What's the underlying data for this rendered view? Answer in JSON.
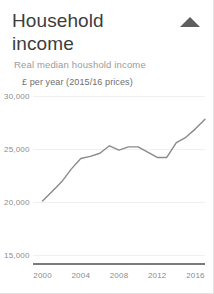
{
  "card": {
    "title": "Household income",
    "subtitle": "Real median houshold income",
    "axis_unit_label": "£ per year (2015/16 prices)",
    "collapse_icon": "triangle-up-icon",
    "accent_color": "#8a8a8a",
    "text_color": "#3d3d3d",
    "muted_color": "#9b9b9b",
    "border_color": "#e3e3e3"
  },
  "chart_data": {
    "type": "line",
    "title": "Household income",
    "subtitle": "Real median houshold income",
    "xlabel": "",
    "ylabel": "£ per year (2015/16 prices)",
    "xlim": [
      1999,
      2017
    ],
    "ylim": [
      15000,
      30000
    ],
    "grid": true,
    "legend": "none",
    "ytick_labels": [
      "30,000",
      "25,000",
      "20,000",
      "15,000"
    ],
    "ytick_values": [
      30000,
      25000,
      20000,
      15000
    ],
    "xtick_labels": [
      "2000",
      "2004",
      "2008",
      "2012",
      "2016"
    ],
    "xtick_values": [
      2000,
      2004,
      2008,
      2012,
      2016
    ],
    "x": [
      2000,
      2001,
      2002,
      2003,
      2004,
      2005,
      2006,
      2007,
      2008,
      2009,
      2010,
      2011,
      2012,
      2013,
      2014,
      2015,
      2016,
      2017
    ],
    "series": [
      {
        "name": "Real median household income",
        "values": [
          20100,
          21000,
          21900,
          23100,
          24100,
          24300,
          24600,
          25300,
          24900,
          25200,
          25200,
          24700,
          24200,
          24200,
          25600,
          26100,
          26900,
          27800
        ]
      }
    ]
  }
}
